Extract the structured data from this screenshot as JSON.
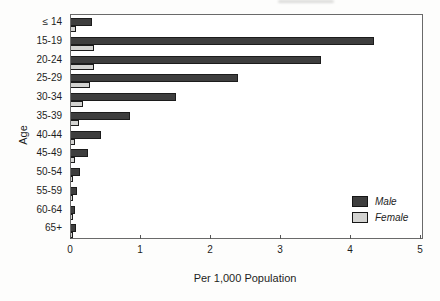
{
  "chart_data": {
    "type": "bar",
    "orientation": "horizontal",
    "title": "",
    "xlabel": "Per 1,000 Population",
    "ylabel": "Age",
    "xlim": [
      0,
      5
    ],
    "xticks": [
      0,
      1,
      2,
      3,
      4,
      5
    ],
    "grid": false,
    "legend_position": "lower right",
    "categories": [
      "≤ 14",
      "15-19",
      "20-24",
      "25-29",
      "30-34",
      "35-39",
      "40-44",
      "45-49",
      "50-54",
      "55-59",
      "60-64",
      "65+"
    ],
    "series": [
      {
        "name": "Male",
        "color": "#3e3e3e",
        "values": [
          0.3,
          4.33,
          3.57,
          2.39,
          1.5,
          0.84,
          0.43,
          0.24,
          0.13,
          0.08,
          0.05,
          0.07
        ]
      },
      {
        "name": "Female",
        "color": "#d3d3d1",
        "values": [
          0.07,
          0.33,
          0.33,
          0.27,
          0.17,
          0.12,
          0.06,
          0.05,
          0.03,
          0.02,
          0.02,
          0.02
        ]
      }
    ]
  }
}
